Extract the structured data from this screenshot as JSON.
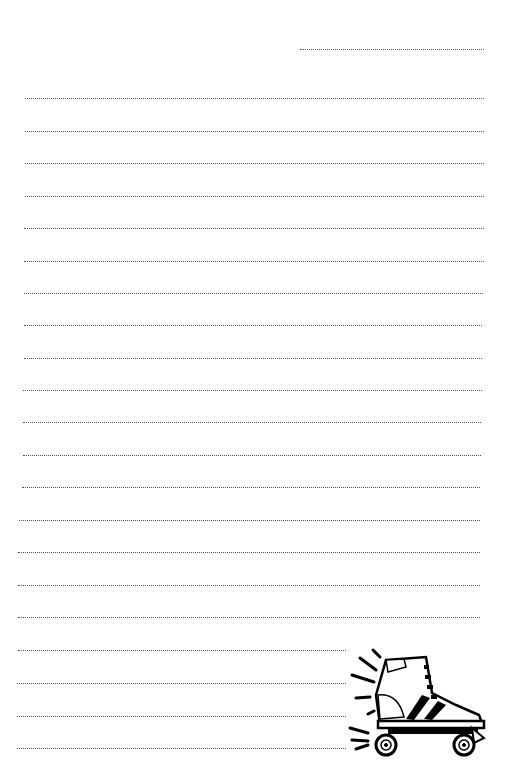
{
  "page": {
    "type": "lined-notepaper",
    "background_color": "#ffffff",
    "line_color": "#555555",
    "line_style": "dotted",
    "header_line": {
      "y": 49,
      "x1": 300,
      "x2": 484
    },
    "lines": [
      {
        "y": 98,
        "x1": 25,
        "x2": 484
      },
      {
        "y": 131,
        "x1": 25,
        "x2": 484
      },
      {
        "y": 163,
        "x1": 25,
        "x2": 484
      },
      {
        "y": 196,
        "x1": 25,
        "x2": 484
      },
      {
        "y": 228,
        "x1": 24,
        "x2": 484
      },
      {
        "y": 261,
        "x1": 24,
        "x2": 484
      },
      {
        "y": 293,
        "x1": 24,
        "x2": 483
      },
      {
        "y": 325,
        "x1": 24,
        "x2": 482
      },
      {
        "y": 358,
        "x1": 24,
        "x2": 482
      },
      {
        "y": 390,
        "x1": 23,
        "x2": 482
      },
      {
        "y": 422,
        "x1": 23,
        "x2": 481
      },
      {
        "y": 455,
        "x1": 23,
        "x2": 481
      },
      {
        "y": 487,
        "x1": 22,
        "x2": 480
      },
      {
        "y": 520,
        "x1": 19,
        "x2": 480
      },
      {
        "y": 552,
        "x1": 18,
        "x2": 480
      },
      {
        "y": 585,
        "x1": 18,
        "x2": 480
      },
      {
        "y": 617,
        "x1": 18,
        "x2": 480
      },
      {
        "y": 650,
        "x1": 18,
        "x2": 480
      },
      {
        "y": 683,
        "x1": 17,
        "x2": 480
      },
      {
        "y": 716,
        "x1": 17,
        "x2": 480
      },
      {
        "y": 748,
        "x1": 17,
        "x2": 480
      }
    ],
    "illustration": {
      "icon": "roller-skate-icon"
    }
  }
}
